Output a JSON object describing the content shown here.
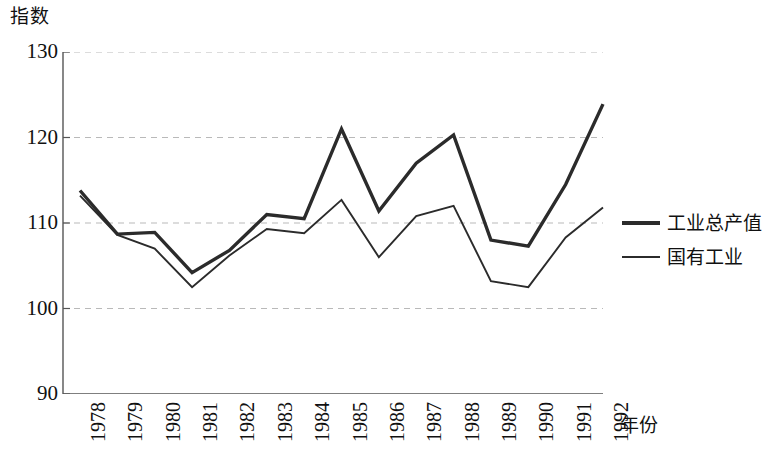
{
  "chart_data": {
    "type": "line",
    "title": "",
    "subtitle": "",
    "xlabel": "年份",
    "ylabel": "指数",
    "y_unit_caption": "指数",
    "categories": [
      "1978",
      "1979",
      "1980",
      "1981",
      "1982",
      "1983",
      "1984",
      "1985",
      "1986",
      "1987",
      "1988",
      "1989",
      "1990",
      "1991",
      "1992"
    ],
    "x": [
      1978,
      1979,
      1980,
      1981,
      1982,
      1983,
      1984,
      1985,
      1986,
      1987,
      1988,
      1989,
      1990,
      1991,
      1992
    ],
    "xlim": [
      1978,
      1992
    ],
    "ylim": [
      90,
      130
    ],
    "yticks": [
      90,
      100,
      110,
      120,
      130
    ],
    "ytick_labels": [
      "90",
      "100",
      "110",
      "120",
      "130"
    ],
    "grid": "horizontal-dashed",
    "grid_color": "#b9b9b9",
    "legend_position": "right",
    "axis_color": "#555555",
    "series": [
      {
        "name": "工业总产值",
        "color": "#2b2b2b",
        "line_width": 3.4,
        "values": [
          113.8,
          108.7,
          108.9,
          104.2,
          106.8,
          111.0,
          110.5,
          121.0,
          111.4,
          117.0,
          120.3,
          108.0,
          107.3,
          114.5,
          123.9
        ]
      },
      {
        "name": "国有工业",
        "color": "#2b2b2b",
        "line_width": 1.9,
        "values": [
          113.2,
          108.6,
          107.0,
          102.5,
          106.2,
          109.3,
          108.8,
          112.7,
          106.0,
          110.8,
          112.0,
          103.2,
          102.5,
          108.3,
          111.8
        ]
      }
    ]
  }
}
